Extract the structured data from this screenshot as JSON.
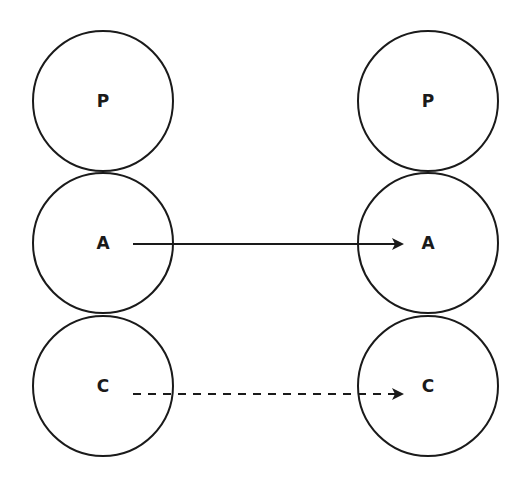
{
  "diagram": {
    "stroke_color": "#1a1a1a",
    "left_column": {
      "nodes": [
        {
          "label": "P",
          "cx": 103,
          "cy": 101,
          "r": 70
        },
        {
          "label": "A",
          "cx": 103,
          "cy": 243,
          "r": 70
        },
        {
          "label": "C",
          "cx": 103,
          "cy": 386,
          "r": 70
        }
      ]
    },
    "right_column": {
      "nodes": [
        {
          "label": "P",
          "cx": 428,
          "cy": 101,
          "r": 70
        },
        {
          "label": "A",
          "cx": 428,
          "cy": 243,
          "r": 70
        },
        {
          "label": "C",
          "cx": 428,
          "cy": 386,
          "r": 70
        }
      ]
    },
    "arrows": [
      {
        "from": "left.A",
        "to": "right.A",
        "style": "solid",
        "x1": 133,
        "y1": 244,
        "x2": 402,
        "y2": 244
      },
      {
        "from": "left.C",
        "to": "right.C",
        "style": "dashed",
        "x1": 133,
        "y1": 394,
        "x2": 402,
        "y2": 394
      }
    ]
  }
}
